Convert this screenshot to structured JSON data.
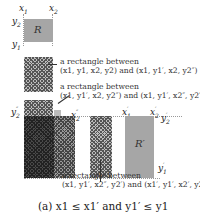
{
  "diagram": {
    "axis_labels": {
      "x1": "x",
      "x1_sub": "1",
      "x2": "x",
      "x2_sub": "2",
      "y2": "y",
      "y2_sub": "2",
      "y1": "y",
      "y1_sub": "1",
      "y2pp": "y",
      "y2pp_sub": "2",
      "y2pp_sup": "″",
      "x2pp": "x",
      "x2pp_sub": "2",
      "x2pp_sup": "″",
      "x1p": "x",
      "x1p_sub": "1",
      "x1p_sup": "′",
      "x2p": "x",
      "x2p_sub": "2",
      "x2p_sup": "′",
      "y2p": "y",
      "y2p_sub": "2",
      "y2p_sup": "′",
      "y1p": "y",
      "y1p_sub": "1",
      "y1p_sup": "′"
    },
    "rect_labels": {
      "R": "R",
      "R_prime": "R′"
    },
    "annotations": [
      {
        "line1": "a rectangle between",
        "line2": "(x1, y1, x2, y2) and (x1, y1′, x2, y2″)"
      },
      {
        "line1": "a rectangle between",
        "line2": "(x1, y1′, x2, y2″) and (x1, y1′, x2″, y2′)"
      },
      {
        "line1": "a rectangle between",
        "line2": "(x1, y1′, x2″, y2′) and (x1′, y1′, x2′, y2′)"
      }
    ],
    "caption": "(a) x1 ≤ x1′ and y1′ ≤ y1",
    "colors": {
      "rect_fill": "#a6a6a6",
      "hatch_light": "#bdbdbd",
      "hatch_dark": "#4a4a4a",
      "guide_line": "#999999"
    }
  }
}
